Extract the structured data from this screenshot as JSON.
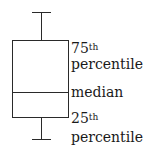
{
  "diagram": {
    "type": "boxplot-legend",
    "labels": {
      "q3_number": "75",
      "q3_suffix": "th",
      "q3_word": "percentile",
      "median": "median",
      "q1_number": "25",
      "q1_suffix": "th",
      "q1_word": "percentile"
    },
    "colors": {
      "line": "#2a2a2a",
      "text": "#1a1a1a",
      "background": "#ffffff"
    }
  }
}
